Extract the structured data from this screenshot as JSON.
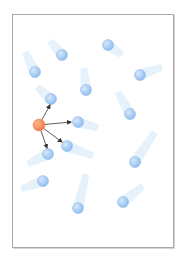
{
  "diagram": {
    "frame": {
      "x": 12,
      "y": 14,
      "width": 161,
      "height": 233,
      "border_color": "#a9a9a9"
    },
    "colors": {
      "tagged_particle": "#f07a45",
      "tagged_particle_highlight": "#ffb48a",
      "molecule": "#8fbcef",
      "molecule_highlight": "#d6e8fb",
      "trail": "#cfe6f8",
      "arrow": "#333333"
    },
    "tagged_particle": {
      "x": 39,
      "y": 125,
      "r": 6
    },
    "molecules": [
      {
        "x": 62,
        "y": 55,
        "r": 5.5,
        "trail_dx": -12,
        "trail_dy": -14
      },
      {
        "x": 108,
        "y": 45,
        "r": 5.5,
        "trail_dx": 14,
        "trail_dy": 10
      },
      {
        "x": 35,
        "y": 72,
        "r": 5.5,
        "trail_dx": -10,
        "trail_dy": -20
      },
      {
        "x": 140,
        "y": 75,
        "r": 5.5,
        "trail_dx": 22,
        "trail_dy": -8
      },
      {
        "x": 86,
        "y": 90,
        "r": 5.5,
        "trail_dx": -2,
        "trail_dy": -22
      },
      {
        "x": 51,
        "y": 99,
        "r": 5.5,
        "trail_dx": -14,
        "trail_dy": -12
      },
      {
        "x": 130,
        "y": 114,
        "r": 5.5,
        "trail_dx": -12,
        "trail_dy": -22
      },
      {
        "x": 78,
        "y": 122,
        "r": 5.5,
        "trail_dx": 20,
        "trail_dy": 6
      },
      {
        "x": 67,
        "y": 146,
        "r": 5.5,
        "trail_dx": 26,
        "trail_dy": 10
      },
      {
        "x": 48,
        "y": 154,
        "r": 5.5,
        "trail_dx": -20,
        "trail_dy": 10
      },
      {
        "x": 135,
        "y": 162,
        "r": 5.5,
        "trail_dx": 20,
        "trail_dy": -30
      },
      {
        "x": 43,
        "y": 181,
        "r": 5.5,
        "trail_dx": -22,
        "trail_dy": 8
      },
      {
        "x": 123,
        "y": 202,
        "r": 5.5,
        "trail_dx": 20,
        "trail_dy": -16
      },
      {
        "x": 78,
        "y": 208,
        "r": 5.5,
        "trail_dx": 8,
        "trail_dy": -34
      }
    ],
    "collision_arrows": [
      {
        "to_x": 50,
        "to_y": 105
      },
      {
        "to_x": 71,
        "to_y": 122
      },
      {
        "to_x": 62,
        "to_y": 142
      },
      {
        "to_x": 47,
        "to_y": 148
      }
    ]
  }
}
